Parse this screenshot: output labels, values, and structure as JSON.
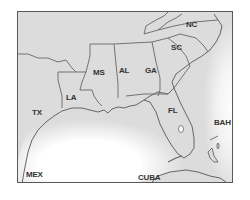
{
  "map": {
    "region": "Southeastern United States and Gulf of Mexico",
    "colors": {
      "land": "#dcdcdc",
      "water": "#ffffff",
      "border": "#666666",
      "frame": "#5a5a5a",
      "label": "#333333"
    },
    "labels": {
      "nc": "NC",
      "sc": "SC",
      "ga": "GA",
      "al": "AL",
      "ms": "MS",
      "la": "LA",
      "tx": "TX",
      "fl": "FL",
      "bah": "BAH",
      "mex": "MEX",
      "cuba": "CUBA"
    }
  }
}
